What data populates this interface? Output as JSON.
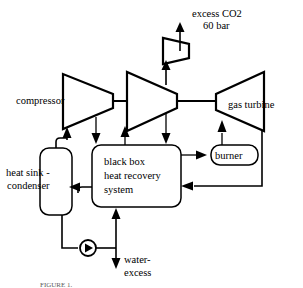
{
  "figure": {
    "caption": "FIGURE 1."
  },
  "labels": {
    "excess_co2": "excess CO2",
    "pressure": "60 bar",
    "compressor": "compressor",
    "gas_turbine": "gas turbine",
    "burner": "burner",
    "heat_sink_line1": "heat sink -",
    "heat_sink_line2": "condenser",
    "black_box_line1": "black box",
    "black_box_line2": "heat recovery",
    "black_box_line3": "system",
    "water_line1": "water-",
    "water_line2": "excess"
  },
  "components": [
    {
      "id": "co2-compressor",
      "type": "trapezoid",
      "label": ""
    },
    {
      "id": "main-compressor",
      "type": "trapezoid",
      "label": "compressor"
    },
    {
      "id": "second-compressor",
      "type": "trapezoid",
      "label": ""
    },
    {
      "id": "gas-turbine",
      "type": "trapezoid",
      "label": "gas turbine"
    },
    {
      "id": "burner",
      "type": "rounded-box",
      "label": "burner"
    },
    {
      "id": "heat-sink-condenser",
      "type": "rounded-box",
      "label": "heat sink - condenser"
    },
    {
      "id": "black-box-heat-recovery",
      "type": "rounded-box",
      "label": "black box heat recovery system"
    },
    {
      "id": "water-pump",
      "type": "pump-symbol",
      "label": ""
    }
  ],
  "colors": {
    "line": "#000000",
    "fill": "#ffffff",
    "caption": "#5a5a5a"
  }
}
